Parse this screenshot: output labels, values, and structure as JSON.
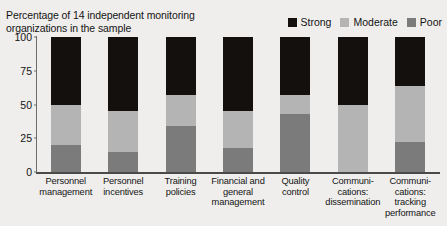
{
  "chart_data": {
    "type": "bar",
    "subtype": "stacked-bar-100",
    "title": "",
    "subtitle": "Percentage of 14 independent monitoring organizations in the sample",
    "xlabel": "",
    "ylabel": "",
    "ylim": [
      0,
      100
    ],
    "yticks": [
      0,
      25,
      50,
      75,
      100
    ],
    "grid": false,
    "legend_position": "top-right",
    "categories": [
      "Personnel management",
      "Personnel incentives",
      "Training policies",
      "Financial and general management",
      "Quality control",
      "Communi-cations: dissemination",
      "Communi-cations: tracking performance"
    ],
    "category_lines": [
      [
        "Personnel",
        "management"
      ],
      [
        "Personnel",
        "incentives"
      ],
      [
        "Training",
        "policies"
      ],
      [
        "Financial and",
        "general",
        "management"
      ],
      [
        "Quality",
        "control"
      ],
      [
        "Communi-",
        "cations:",
        "dissemination"
      ],
      [
        "Communi-",
        "cations:",
        "tracking",
        "performance"
      ]
    ],
    "series": [
      {
        "name": "Strong",
        "color": "#13100e",
        "values": [
          50,
          55,
          43,
          55,
          43,
          50,
          36
        ]
      },
      {
        "name": "Moderate",
        "color": "#b4b4b4",
        "values": [
          30,
          30,
          23,
          27,
          14,
          50,
          42
        ]
      },
      {
        "name": "Poor",
        "color": "#7b7b7b",
        "values": [
          20,
          15,
          34,
          18,
          43,
          0,
          22
        ]
      }
    ]
  },
  "legend": {
    "items": [
      {
        "label": "Strong",
        "color": "#13100e"
      },
      {
        "label": "Moderate",
        "color": "#b4b4b4"
      },
      {
        "label": "Poor",
        "color": "#7b7b7b"
      }
    ]
  },
  "colors": {
    "background": "#efeeec",
    "axis": "#4a4a4a",
    "text": "#141414",
    "strong": "#13100e",
    "moderate": "#b4b4b4",
    "poor": "#7b7b7b"
  }
}
